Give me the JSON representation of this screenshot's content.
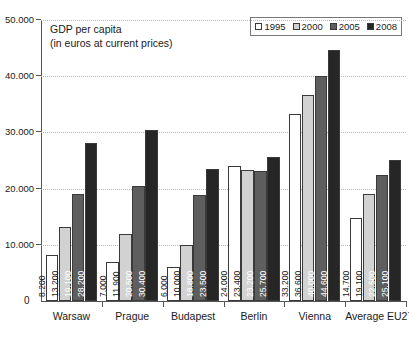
{
  "chart_data": {
    "type": "bar",
    "title": "GDP per capita",
    "subtitle": "(in euros at current prices)",
    "xlabel": "",
    "ylabel": "",
    "ylim": [
      0,
      50000
    ],
    "grid": true,
    "legend_position": "top-right",
    "y_ticks": [
      "10.000",
      "20.000",
      "30.000",
      "40.000",
      "50.000"
    ],
    "y_tick_values": [
      10000,
      20000,
      30000,
      40000,
      50000
    ],
    "zero_label": "0",
    "categories": [
      "Warsaw",
      "Prague",
      "Budapest",
      "Berlin",
      "Vienna",
      "Average EU27"
    ],
    "series": [
      {
        "name": "1995",
        "color": "#ffffff",
        "values": [
          8200,
          7000,
          6000,
          24000,
          33200,
          14700
        ],
        "labels": [
          "8.200",
          "7.000",
          "6.000",
          "24.000",
          "33.200",
          "14.700"
        ],
        "label_color": "#1a1a1a"
      },
      {
        "name": "2000",
        "color": "#d2d2d2",
        "values": [
          13200,
          11900,
          10000,
          23400,
          36600,
          19100
        ],
        "labels": [
          "13.200",
          "11.900",
          "10.000",
          "23.400",
          "36.600",
          "19.100"
        ],
        "label_color": "#1a1a1a"
      },
      {
        "name": "2005",
        "color": "#5e5e5e",
        "values": [
          19100,
          20500,
          18800,
          23200,
          40000,
          22500
        ],
        "labels": [
          "19.100",
          "20.500",
          "18.800",
          "23.200",
          "40.000",
          "22.500"
        ],
        "label_color": "#ffffff"
      },
      {
        "name": "2008",
        "color": "#262626",
        "values": [
          28200,
          30400,
          23500,
          25700,
          44600,
          25100
        ],
        "labels": [
          "28.200",
          "30.400",
          "23.500",
          "25.700",
          "44.600",
          "25.100"
        ],
        "label_color": "#ffffff"
      }
    ]
  },
  "legend": {
    "items": [
      {
        "label": "1995",
        "color": "#ffffff"
      },
      {
        "label": "2000",
        "color": "#d2d2d2"
      },
      {
        "label": "2005",
        "color": "#5e5e5e"
      },
      {
        "label": "2008",
        "color": "#262626"
      }
    ]
  }
}
